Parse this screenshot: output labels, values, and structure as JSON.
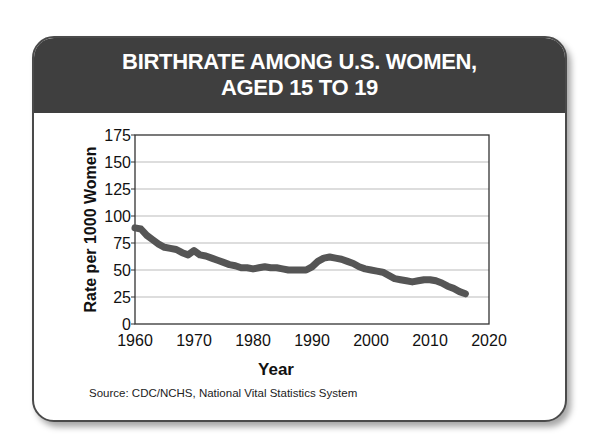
{
  "card": {
    "title_line1": "BIRTHRATE AMONG U.S. WOMEN,",
    "title_line2": "AGED 15 TO 19",
    "source": "Source: CDC/NCHS, National Vital Statistics System"
  },
  "colors": {
    "header_bg": "#3f3f3f",
    "line": "#555555",
    "grid": "#bbbbbb",
    "axis": "#333333"
  },
  "chart_data": {
    "type": "line",
    "title": "BIRTHRATE AMONG U.S. WOMEN, AGED 15 TO 19",
    "xlabel": "Year",
    "ylabel": "Rate per 1000 Women",
    "xlim": [
      1960,
      2020
    ],
    "ylim": [
      0,
      175
    ],
    "x_ticks": [
      1960,
      1970,
      1980,
      1990,
      2000,
      2010,
      2020
    ],
    "y_ticks": [
      0,
      25,
      50,
      75,
      100,
      125,
      150,
      175
    ],
    "grid": "horizontal",
    "legend": "none",
    "source": "Source: CDC/NCHS, National Vital Statistics System",
    "series": [
      {
        "name": "Birthrate (ages 15-19)",
        "x": [
          1960,
          1961,
          1962,
          1963,
          1964,
          1965,
          1966,
          1967,
          1968,
          1969,
          1970,
          1971,
          1972,
          1973,
          1974,
          1975,
          1976,
          1977,
          1978,
          1979,
          1980,
          1981,
          1982,
          1983,
          1984,
          1985,
          1986,
          1987,
          1988,
          1989,
          1990,
          1991,
          1992,
          1993,
          1994,
          1995,
          1996,
          1997,
          1998,
          1999,
          2000,
          2001,
          2002,
          2003,
          2004,
          2005,
          2006,
          2007,
          2008,
          2009,
          2010,
          2011,
          2012,
          2013,
          2014,
          2015,
          2016
        ],
        "values": [
          89,
          88,
          82,
          78,
          74,
          71,
          70,
          69,
          66,
          64,
          68,
          64,
          63,
          61,
          59,
          57,
          55,
          54,
          52,
          52,
          51,
          52,
          53,
          52,
          52,
          51,
          50,
          50,
          50,
          50,
          53,
          58,
          61,
          62,
          61,
          60,
          58,
          56,
          53,
          51,
          50,
          49,
          48,
          45,
          42,
          41,
          40,
          39,
          40,
          41,
          41,
          40,
          38,
          35,
          33,
          30,
          28
        ]
      }
    ]
  }
}
